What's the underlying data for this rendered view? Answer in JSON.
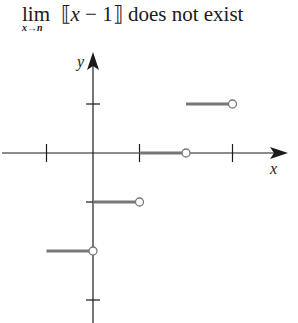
{
  "title": {
    "lim": "lim",
    "subscript": "x→n",
    "bracket_open": "⟦",
    "var": "x",
    "minus_one": " − 1",
    "bracket_close": "⟧",
    "rest": " does not exist"
  },
  "chart_data": {
    "type": "line",
    "xlabel": "x",
    "ylabel": "y",
    "function": "f(x) = [[x − 1]] (greatest integer / floor of x − 1)",
    "xlim": [
      -1,
      4
    ],
    "ylim": [
      -3,
      2
    ],
    "x_ticks": [
      -1,
      0,
      1,
      2,
      3
    ],
    "y_ticks": [
      1,
      0,
      -1,
      -2,
      -3
    ],
    "grid": false,
    "segments": [
      {
        "x_start": -1,
        "x_end": 0,
        "y": -2,
        "left_closed": true,
        "right_open": true
      },
      {
        "x_start": 0,
        "x_end": 1,
        "y": -1,
        "left_closed": true,
        "right_open": true
      },
      {
        "x_start": 1,
        "x_end": 2,
        "y": 0,
        "left_closed": true,
        "right_open": true
      },
      {
        "x_start": 2,
        "x_end": 3,
        "y": 1,
        "left_closed": true,
        "right_open": true
      }
    ],
    "line_color": "#777777",
    "axis_color": "#1a1a1a"
  }
}
